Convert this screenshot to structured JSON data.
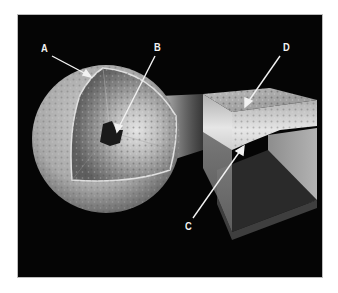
{
  "diagram": {
    "labels": [
      {
        "id": "A",
        "text": "A",
        "x": 41,
        "y": 43,
        "target": "outer ice shell of sphere"
      },
      {
        "id": "B",
        "text": "B",
        "x": 154,
        "y": 42,
        "target": "dark core at center of sphere"
      },
      {
        "id": "C",
        "text": "C",
        "x": 185,
        "y": 221,
        "target": "liquid layer inside cube"
      },
      {
        "id": "D",
        "text": "D",
        "x": 283,
        "y": 42,
        "target": "icy surface crust on top of cube"
      }
    ],
    "colors": {
      "background": "#050505",
      "frame": "#bdbdbd",
      "page": "#ffffff",
      "label": "#f2f2f2",
      "sphere_surface": "#b5b5b5",
      "mantle": "#8a8a8a",
      "core": "#1a1a1a",
      "cube_ice": "#c9c9c9",
      "cube_water": "#8c8c8c",
      "cube_floor": "#2a2a2a"
    }
  }
}
